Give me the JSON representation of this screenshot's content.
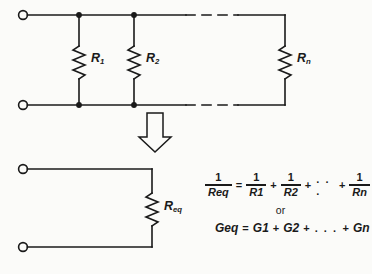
{
  "figure": {
    "background_color": "#fbfbf9",
    "ink_color": "#1a1a1a"
  },
  "top_circuit": {
    "name": "parallel-resistor-network",
    "terminals": [
      "top-left-terminal",
      "bottom-left-terminal"
    ],
    "resistors": [
      {
        "id": "R1",
        "base": "R",
        "subscript": "1"
      },
      {
        "id": "R2",
        "base": "R",
        "subscript": "2"
      },
      {
        "id": "Rn",
        "base": "R",
        "subscript": "n"
      }
    ],
    "dashed_continuation": true,
    "junction_dots": 4
  },
  "transition": {
    "arrow": "down-arrow",
    "style": "hollow-outline"
  },
  "bottom_circuit": {
    "name": "equivalent-resistance-circuit",
    "terminals": [
      "top-left-terminal",
      "bottom-left-terminal"
    ],
    "resistor": {
      "id": "Req",
      "base": "R",
      "subscript": "eq"
    }
  },
  "equations": {
    "equation1": {
      "lhs": {
        "numerator": "1",
        "denominator_base": "R",
        "denominator_sub": "eq"
      },
      "equals": "=",
      "terms": [
        {
          "numerator": "1",
          "denominator_base": "R",
          "denominator_sub": "1"
        },
        {
          "numerator": "1",
          "denominator_base": "R",
          "denominator_sub": "2"
        },
        {
          "numerator": "1",
          "denominator_base": "R",
          "denominator_sub": "n"
        }
      ],
      "plus": "+",
      "ellipsis": ". . ."
    },
    "connector": "or",
    "equation2": {
      "lhs_base": "G",
      "lhs_sub": "eq",
      "equals": "=",
      "terms": [
        {
          "base": "G",
          "sub": "1"
        },
        {
          "base": "G",
          "sub": "2"
        },
        {
          "base": "G",
          "sub": "n"
        }
      ],
      "plus": "+",
      "ellipsis": ". . ."
    }
  }
}
